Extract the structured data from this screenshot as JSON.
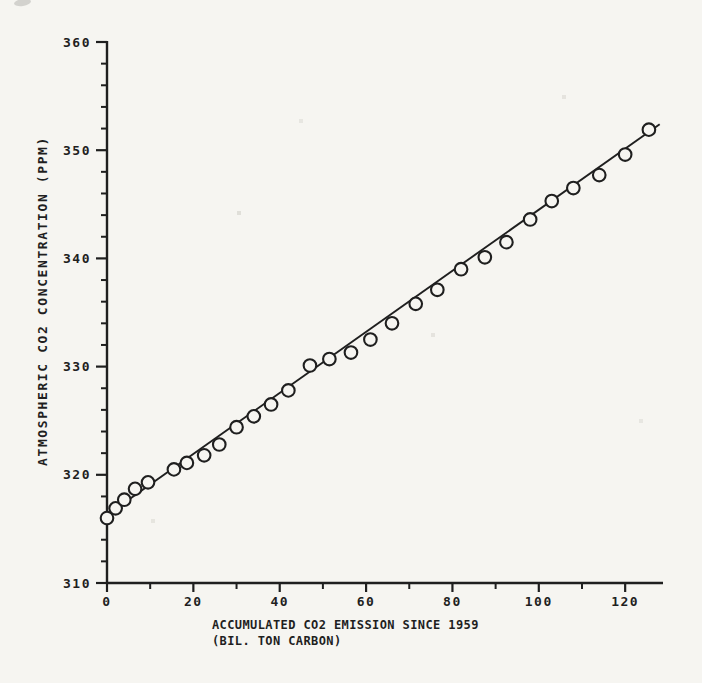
{
  "figure": {
    "paper_color": "#f6f5f1",
    "ink_color": "#1f1f1f"
  },
  "chart_data": {
    "type": "scatter",
    "title": "",
    "xlabel": "ACCUMULATED CO2 EMISSION SINCE 1959",
    "xlabel_line2": "(BIL. TON CARBON)",
    "ylabel": "ATMOSPHERIC CO2 CONCENTRATION (PPM)",
    "xlim": [
      0,
      128.5
    ],
    "ylim": [
      310,
      360
    ],
    "x_major_ticks": [
      0,
      20,
      40,
      60,
      80,
      100,
      120
    ],
    "x_minor_step": 10,
    "y_major_ticks": [
      310,
      320,
      330,
      340,
      350,
      360
    ],
    "y_minor_step": 2,
    "grid": false,
    "legend": "none",
    "marker": "open-circle",
    "points": [
      [
        0,
        316.0
      ],
      [
        2,
        316.9
      ],
      [
        4,
        317.7
      ],
      [
        6.5,
        318.7
      ],
      [
        9.5,
        319.3
      ],
      [
        15.5,
        320.5
      ],
      [
        18.5,
        321.1
      ],
      [
        22.5,
        321.8
      ],
      [
        26,
        322.8
      ],
      [
        30,
        324.4
      ],
      [
        34,
        325.4
      ],
      [
        38,
        326.5
      ],
      [
        42,
        327.8
      ],
      [
        47,
        330.1
      ],
      [
        51.5,
        330.7
      ],
      [
        56.5,
        331.3
      ],
      [
        61,
        332.5
      ],
      [
        66,
        334.0
      ],
      [
        71.5,
        335.8
      ],
      [
        76.5,
        337.1
      ],
      [
        82,
        339.0
      ],
      [
        87.5,
        340.1
      ],
      [
        92.5,
        341.5
      ],
      [
        98,
        343.6
      ],
      [
        103,
        345.3
      ],
      [
        108,
        346.5
      ],
      [
        114,
        347.7
      ],
      [
        120,
        349.6
      ],
      [
        125.5,
        351.9
      ]
    ],
    "trend_line": {
      "x1": -1,
      "y1": 316.0,
      "x2": 128,
      "y2": 352.4
    }
  }
}
